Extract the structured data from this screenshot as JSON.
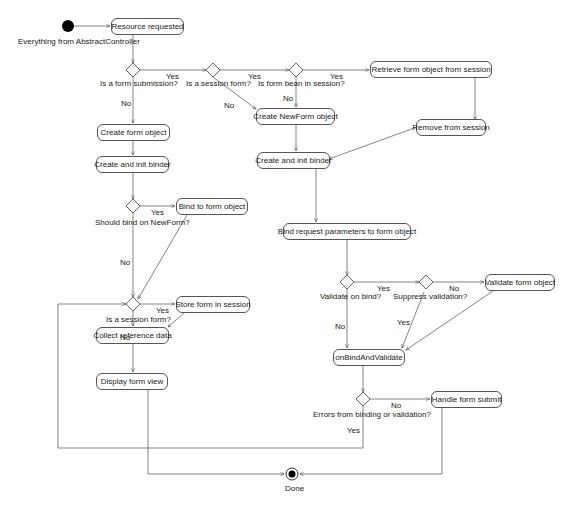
{
  "diagram": {
    "type": "activity-diagram",
    "start": {
      "label": "Everything from AbstractController"
    },
    "end": {
      "label": "Done"
    },
    "actions": {
      "resource_requested": "Resource requested",
      "retrieve_form": "Retrieve form object from session",
      "remove_from_session": "Remove from session",
      "create_form_object": "Create form object",
      "create_newform_object": "Create NewForm object",
      "create_init_binder_left": "Create and init binder",
      "create_init_binder_right": "Create and init binder",
      "bind_to_form_object": "Bind to form object",
      "bind_request_params": "Bind request parameters to form object",
      "store_form_in_session": "Store form in session",
      "collect_reference_data": "Collect reference data",
      "display_form_view": "Display form view",
      "validate_form_object": "Validate form object",
      "on_bind_and_validate": "onBindAndValidate",
      "handle_form_submit": "Handle form submit"
    },
    "decisions": {
      "is_form_submission": "Is a form submission?",
      "is_session_form_top": "Is a session form?",
      "is_form_bean_in_session": "Is form bean in session?",
      "should_bind_on_newform": "Should bind on NewForm?",
      "is_session_form_bottom": "Is a session form?",
      "validate_on_bind": "Validate on bind?",
      "suppress_validation": "Suppress validation?",
      "errors_from_binding": "Errors from binding or validation?"
    },
    "guards": {
      "yes": "Yes",
      "no": "No"
    },
    "colors": {
      "line": "#555555",
      "node_border": "#555555",
      "start_fill": "#000000"
    }
  }
}
